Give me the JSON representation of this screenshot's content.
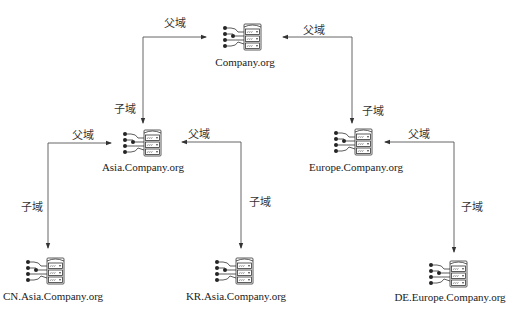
{
  "diagram": {
    "type": "domain-tree",
    "nodes": [
      {
        "id": "root",
        "label": "Company.org",
        "icon": "server-network-icon"
      },
      {
        "id": "asia",
        "label": "Asia.Company.org",
        "icon": "server-network-icon"
      },
      {
        "id": "europe",
        "label": "Europe.Company.org",
        "icon": "server-network-icon"
      },
      {
        "id": "cn",
        "label": "CN.Asia.Company.org",
        "icon": "server-network-icon"
      },
      {
        "id": "kr",
        "label": "KR.Asia.Company.org",
        "icon": "server-network-icon"
      },
      {
        "id": "de",
        "label": "DE.Europe.Company.org",
        "icon": "server-network-icon"
      }
    ],
    "edges": [
      {
        "from": "asia",
        "to": "root",
        "parent_label": "父域",
        "child_label": "子域"
      },
      {
        "from": "europe",
        "to": "root",
        "parent_label": "父域",
        "child_label": "子域"
      },
      {
        "from": "cn",
        "to": "asia",
        "parent_label": "父域",
        "child_label": "子域"
      },
      {
        "from": "kr",
        "to": "asia",
        "parent_label": "父域",
        "child_label": "子域"
      },
      {
        "from": "de",
        "to": "europe",
        "parent_label": "父域",
        "child_label": "子域"
      }
    ],
    "line_color": "#555555"
  }
}
